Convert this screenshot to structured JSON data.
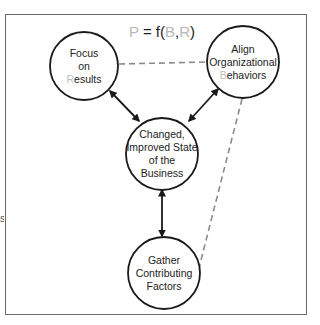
{
  "title": {
    "p": "P",
    "eq": " = f(",
    "b": "B",
    "comma": ",",
    "r": "R",
    "close": ")"
  },
  "nodes": {
    "focus": {
      "line1": "Focus",
      "line2": "on",
      "line3_first": "R",
      "line3_rest": "esults"
    },
    "align": {
      "line1": "Align",
      "line2": "Organizational",
      "line3_first": "B",
      "line3_rest": "ehaviors"
    },
    "changed": {
      "line1": "Changed,",
      "line2": "Improved State",
      "line3": "of the",
      "line4": "Business"
    },
    "gather": {
      "line1": "Gather",
      "line2": "Contributing",
      "line3": "Factors"
    }
  },
  "side_mark": "s",
  "colors": {
    "stroke": "#1a1a1a",
    "dashed": "#8a8a8a",
    "frame": "#6a6a6a",
    "highlight_letter": "#bdbdbd"
  }
}
